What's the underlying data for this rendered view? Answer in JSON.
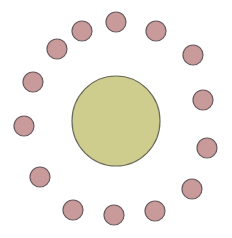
{
  "diagram": {
    "width": 232,
    "height": 238,
    "background": "#ffffff",
    "center_node": {
      "cx": 116,
      "cy": 121,
      "rx": 44,
      "ry": 45,
      "fill": "#cfcd8e",
      "stroke": "#6b6b5a"
    },
    "satellite_style": {
      "r": 10,
      "fill": "#c99a9a",
      "stroke": "#6a5a5e"
    },
    "satellites": [
      {
        "cx": 116,
        "cy": 22
      },
      {
        "cx": 156,
        "cy": 31
      },
      {
        "cx": 193,
        "cy": 55
      },
      {
        "cx": 203,
        "cy": 100
      },
      {
        "cx": 207,
        "cy": 148
      },
      {
        "cx": 192,
        "cy": 189
      },
      {
        "cx": 155,
        "cy": 211
      },
      {
        "cx": 114,
        "cy": 215
      },
      {
        "cx": 73,
        "cy": 210
      },
      {
        "cx": 40,
        "cy": 177
      },
      {
        "cx": 24,
        "cy": 126
      },
      {
        "cx": 33,
        "cy": 82
      },
      {
        "cx": 57,
        "cy": 49
      },
      {
        "cx": 82,
        "cy": 31
      }
    ]
  }
}
